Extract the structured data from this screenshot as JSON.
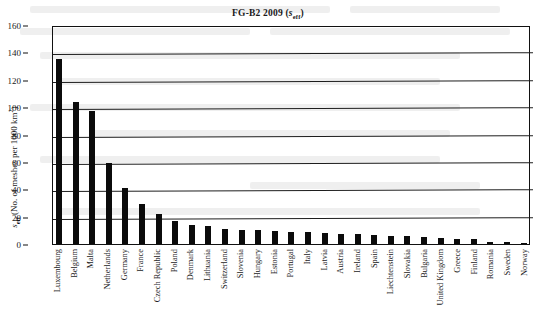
{
  "chart_data": {
    "type": "bar",
    "title_parts": {
      "main": "FG-B2 2009 (",
      "italic": "s",
      "sub": "eff",
      "tail": ")"
    },
    "xlabel": "",
    "ylabel": "s_eff (No. of meshes per 1000 km2)",
    "ylabel_parts": {
      "italic": "s",
      "sub": "eff",
      "text": " (No. of meshes per 1000 km",
      "sup": "2",
      "tail": ")"
    },
    "ylim": [
      0,
      160
    ],
    "ytick_step": 20,
    "yticks": [
      0,
      20,
      40,
      60,
      80,
      100,
      120,
      140,
      160
    ],
    "ytick_labels": [
      "0",
      "20",
      "40",
      "60",
      "80",
      "100",
      "120",
      "140",
      "160"
    ],
    "grid": true,
    "legend": "none",
    "bar_color": "#0b0b0b",
    "categories": [
      "Luxembourg",
      "Belgium",
      "Malta",
      "Netherlands",
      "Germany",
      "France",
      "Czech Republic",
      "Poland",
      "Denmark",
      "Lithuania",
      "Switzerland",
      "Slovenia",
      "Hungary",
      "Estonia",
      "Portugal",
      "Italy",
      "Latvia",
      "Austria",
      "Ireland",
      "Spain",
      "Liechtenstein",
      "Slovakia",
      "Bulgaria",
      "United Kingdom",
      "Greece",
      "Finland",
      "Romania",
      "Sweden",
      "Norway"
    ],
    "values": [
      135,
      104,
      97,
      59,
      41,
      29,
      22,
      17,
      14,
      13,
      11,
      10.5,
      10,
      9.5,
      9,
      8.5,
      8,
      7.5,
      7,
      6.5,
      6,
      5.5,
      5,
      4.5,
      4,
      3.5,
      1.5,
      1.2,
      1
    ]
  }
}
